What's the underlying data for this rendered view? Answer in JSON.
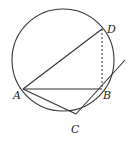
{
  "diagram": {
    "type": "geometry",
    "colors": {
      "stroke": "#333333",
      "background": "#ffffff"
    },
    "circle": {
      "cx": 63,
      "cy": 60,
      "r": 51
    },
    "points": {
      "A": {
        "label": "A",
        "x": 23,
        "y": 89
      },
      "B": {
        "label": "B",
        "x": 102,
        "y": 89
      },
      "C": {
        "label": "C",
        "x": 76,
        "y": 114
      },
      "D": {
        "label": "D",
        "x": 102,
        "y": 29
      }
    },
    "segments": [
      {
        "from": "A",
        "to": "D",
        "style": "solid"
      },
      {
        "from": "A",
        "to": "B",
        "style": "solid"
      },
      {
        "from": "D",
        "to": "B",
        "style": "dashed"
      },
      {
        "from": "A",
        "to": "C",
        "style": "solid"
      },
      {
        "from": "C",
        "to": "B",
        "style": "solid",
        "extended_to": {
          "x": 125,
          "y": 60
        },
        "note": "tangent at B"
      }
    ]
  }
}
